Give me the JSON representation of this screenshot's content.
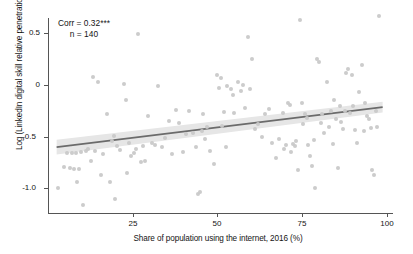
{
  "chart_data": {
    "type": "scatter",
    "title": "",
    "xlabel": "Share of population using the internet, 2016 (%)",
    "ylabel": "Log (LinkedIn digital skill relative penetration), 2018",
    "xlim": [
      2,
      102
    ],
    "ylim": [
      -1.32,
      0.72
    ],
    "xticks": [
      25,
      50,
      75,
      100
    ],
    "xtick_labels": [
      "25",
      "50",
      "75",
      "100"
    ],
    "yticks": [
      0.5,
      0,
      -0.5,
      -1.0
    ],
    "ytick_labels": [
      "0.5",
      "0",
      "-0.5",
      "-1.0"
    ],
    "grid": false,
    "legend": "none",
    "point_color": "#c9c9c9",
    "fit_line_color": "#6b6b6b",
    "fit_band_color": "#e6e6e6",
    "annotation": {
      "corr_line": "Corr = 0.32***",
      "n_line": "n = 140",
      "corr": 0.32,
      "significance": "***",
      "n": 140
    },
    "fit_line": {
      "type": "linear",
      "x_start": 4.5,
      "y_start": -0.645,
      "x_end": 99.0,
      "y_end": -0.235,
      "band_halfwidth_start": 0.075,
      "band_halfwidth_end": 0.055
    },
    "x": [
      5.0,
      6.5,
      7.5,
      8.5,
      9.0,
      9.5,
      10.0,
      10.5,
      11.0,
      11.5,
      12.0,
      13.0,
      13.5,
      14.5,
      15.0,
      15.5,
      16.5,
      17.5,
      18.0,
      19.0,
      20.0,
      20.5,
      21.0,
      21.5,
      22.0,
      23.0,
      24.0,
      24.5,
      25.0,
      25.5,
      26.0,
      27.0,
      27.5,
      28.0,
      29.0,
      29.5,
      30.0,
      31.0,
      32.0,
      33.0,
      34.0,
      35.0,
      36.0,
      37.0,
      38.0,
      39.0,
      40.0,
      41.0,
      42.0,
      43.0,
      44.0,
      45.0,
      45.5,
      46.0,
      46.5,
      47.0,
      47.5,
      48.0,
      49.0,
      50.0,
      51.0,
      51.5,
      52.0,
      52.5,
      53.0,
      53.5,
      54.0,
      55.0,
      55.5,
      56.0,
      57.0,
      58.0,
      58.5,
      59.0,
      60.0,
      60.5,
      61.0,
      62.0,
      63.0,
      64.0,
      65.0,
      66.0,
      67.0,
      68.0,
      69.0,
      70.0,
      70.5,
      71.0,
      71.5,
      72.0,
      72.5,
      73.0,
      73.5,
      74.0,
      74.5,
      75.0,
      75.5,
      76.0,
      76.5,
      77.0,
      77.5,
      78.0,
      78.5,
      79.0,
      79.5,
      80.0,
      80.5,
      81.0,
      81.5,
      82.0,
      83.0,
      83.5,
      84.0,
      84.5,
      85.0,
      85.5,
      86.0,
      86.5,
      87.0,
      87.5,
      88.0,
      88.5,
      89.0,
      89.5,
      90.0,
      90.5,
      91.0,
      91.5,
      92.0,
      93.0,
      93.5,
      94.0,
      94.5,
      95.0,
      95.5,
      96.0,
      96.5,
      97.0,
      97.5,
      98.0
    ],
    "y": [
      -1.06,
      -0.85,
      -0.7,
      -0.86,
      -0.71,
      -0.87,
      -0.7,
      -1.0,
      -0.87,
      -0.69,
      -1.24,
      -0.68,
      -0.66,
      -0.79,
      0.07,
      -0.68,
      0.02,
      -0.93,
      -0.72,
      -0.3,
      -1.0,
      -0.58,
      -0.53,
      -1.18,
      -0.63,
      -0.67,
      0.0,
      -0.16,
      -0.91,
      -0.6,
      -0.74,
      -0.7,
      -0.66,
      0.51,
      -0.8,
      -0.63,
      -0.79,
      -0.33,
      -0.6,
      -0.62,
      -0.02,
      -0.64,
      -0.55,
      -0.38,
      -0.72,
      -0.26,
      -0.4,
      -0.69,
      -0.51,
      -0.27,
      -0.5,
      -0.64,
      -1.13,
      -1.1,
      -0.48,
      -0.3,
      -0.56,
      -0.44,
      -0.68,
      -0.82,
      0.09,
      -0.04,
      0.06,
      -0.43,
      -0.28,
      -0.64,
      -0.02,
      -0.05,
      -0.11,
      -0.29,
      0.02,
      -0.07,
      -0.01,
      -0.24,
      0.48,
      -0.05,
      0.26,
      -0.46,
      -0.41,
      -0.54,
      -0.31,
      -0.25,
      -0.6,
      -0.76,
      -0.56,
      -0.29,
      -0.66,
      -0.62,
      -0.19,
      -0.21,
      -0.69,
      -0.61,
      -0.63,
      -0.58,
      -0.88,
      0.66,
      -0.19,
      -0.41,
      -0.31,
      -0.35,
      -0.62,
      -0.74,
      -0.84,
      -0.57,
      -1.06,
      0.26,
      0.23,
      -0.4,
      -0.3,
      -0.5,
      0.02,
      -0.44,
      -0.27,
      -0.61,
      -0.16,
      -0.36,
      -0.86,
      -0.22,
      -0.39,
      -0.46,
      -0.27,
      0.12,
      0.16,
      -0.29,
      0.09,
      -0.22,
      -0.47,
      -0.6,
      -0.08,
      0.2,
      -0.48,
      -0.19,
      -0.33,
      -0.36,
      -0.45,
      -0.88,
      -0.93,
      -0.27,
      -0.44
    ]
  }
}
